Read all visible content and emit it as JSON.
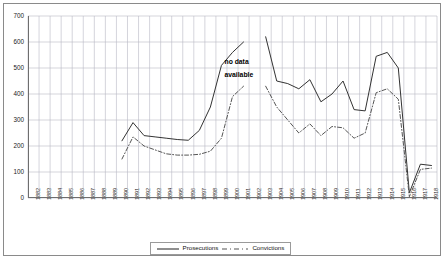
{
  "chart_data": {
    "type": "line",
    "title": "",
    "subtitle": "",
    "xlabel": "",
    "ylabel": "",
    "ylim": [
      0,
      700
    ],
    "ytick_step": 100,
    "yticks": [
      0,
      100,
      200,
      300,
      400,
      500,
      600,
      700
    ],
    "grid": true,
    "grid_axis": "both",
    "legend_position": "bottom-center",
    "categories": [
      "1882",
      "1883",
      "1884",
      "1885",
      "1886",
      "1887",
      "1888",
      "1889",
      "1890",
      "1891",
      "1892",
      "1893",
      "1894",
      "1895",
      "1896",
      "1897",
      "1898",
      "1899",
      "1900",
      "1901",
      "1902",
      "1903",
      "1904",
      "1905",
      "1906",
      "1907",
      "1908",
      "1909",
      "1910",
      "1911",
      "1912",
      "1913",
      "1914",
      "1915",
      "1916",
      "1917",
      "1918"
    ],
    "annotations": [
      {
        "text": "no data",
        "x_category": "1900",
        "y_value": 520
      },
      {
        "text": "available",
        "x_category": "1900",
        "y_value": 455
      }
    ],
    "gaps": [
      {
        "after_category": "1901",
        "before_category": "1902",
        "reason": "no data available"
      }
    ],
    "series": [
      {
        "name": "Prosecutions",
        "style": "solid",
        "color": "#333333",
        "values": [
          null,
          null,
          null,
          null,
          null,
          null,
          null,
          null,
          220,
          290,
          240,
          235,
          230,
          225,
          222,
          260,
          350,
          510,
          560,
          600,
          null,
          620,
          450,
          440,
          420,
          455,
          370,
          400,
          450,
          340,
          335,
          545,
          560,
          500,
          20,
          130,
          125
        ]
      },
      {
        "name": "Convictions",
        "style": "dash-dot",
        "color": "#555555",
        "values": [
          null,
          null,
          null,
          null,
          null,
          null,
          null,
          null,
          150,
          235,
          200,
          185,
          170,
          165,
          165,
          168,
          180,
          230,
          390,
          430,
          null,
          430,
          350,
          300,
          250,
          285,
          240,
          275,
          270,
          230,
          250,
          405,
          420,
          380,
          5,
          110,
          115
        ]
      }
    ]
  },
  "legend": {
    "items": [
      {
        "label": "Prosecutions",
        "key": "solid-line-key"
      },
      {
        "label": "Convictions",
        "key": "dashdot-line-key"
      }
    ]
  }
}
